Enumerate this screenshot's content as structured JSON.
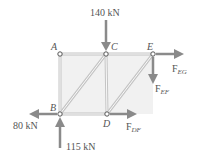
{
  "diagram": {
    "nodes": [
      {
        "id": "A",
        "label": "A",
        "x": 60,
        "y": 54
      },
      {
        "id": "C",
        "label": "C",
        "x": 106,
        "y": 54
      },
      {
        "id": "E",
        "label": "E",
        "x": 153,
        "y": 54
      },
      {
        "id": "B",
        "label": "B",
        "x": 60,
        "y": 114
      },
      {
        "id": "D",
        "label": "D",
        "x": 107,
        "y": 114
      }
    ],
    "loads": {
      "top": {
        "value": "140 kN",
        "on": "C",
        "direction": "down"
      },
      "left": {
        "value": "80 kN",
        "on": "B",
        "direction": "left"
      },
      "bottom": {
        "value": "115 kN",
        "on": "B",
        "direction": "up"
      }
    },
    "member_forces": {
      "eg": {
        "main": "F",
        "sub": "EG",
        "on": "E",
        "direction": "right"
      },
      "ef": {
        "main": "F",
        "sub": "EF",
        "on": "E",
        "direction": "down"
      },
      "df": {
        "main": "F",
        "sub": "DF",
        "on": "D",
        "direction": "right"
      }
    },
    "colors": {
      "arrow": "#8a8a8a",
      "member": "#c8c8c8",
      "fill": "#efefef",
      "text": "#555555"
    }
  }
}
